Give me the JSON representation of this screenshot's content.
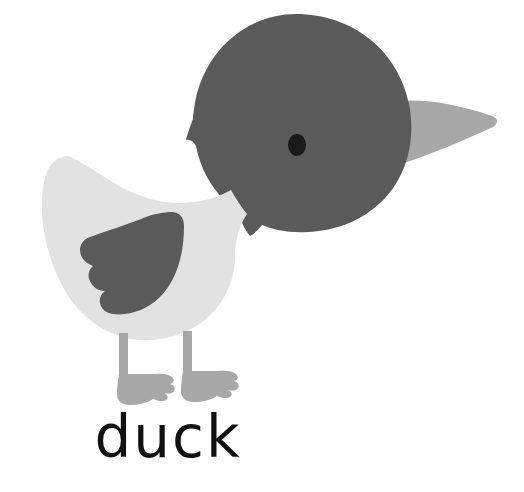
{
  "illustration": {
    "subject": "duck",
    "style": "flat vector cartoon",
    "background_color": "#ffffff",
    "caption": {
      "text": "duck",
      "color": "#111111",
      "align": "center-left"
    },
    "palette": {
      "head": "#5a5a5a",
      "wing": "#5a5a5a",
      "beak": "#a8a8a8",
      "body": "#e2e2e2",
      "legs": "#a8a8a8",
      "feet": "#a8a8a8",
      "eye": "#1a1a1a",
      "background": "#ffffff"
    },
    "parts": [
      {
        "name": "head",
        "label": "Head",
        "color": "#5a5a5a"
      },
      {
        "name": "eye",
        "label": "Eye",
        "color": "#1a1a1a"
      },
      {
        "name": "beak",
        "label": "Beak",
        "color": "#a8a8a8"
      },
      {
        "name": "body",
        "label": "Body",
        "color": "#e2e2e2"
      },
      {
        "name": "wing",
        "label": "Wing",
        "color": "#5a5a5a"
      },
      {
        "name": "left-leg",
        "label": "Left leg",
        "color": "#a8a8a8"
      },
      {
        "name": "right-leg",
        "label": "Right leg",
        "color": "#a8a8a8"
      },
      {
        "name": "left-foot",
        "label": "Left foot",
        "color": "#a8a8a8"
      },
      {
        "name": "right-foot",
        "label": "Right foot",
        "color": "#a8a8a8"
      }
    ]
  }
}
